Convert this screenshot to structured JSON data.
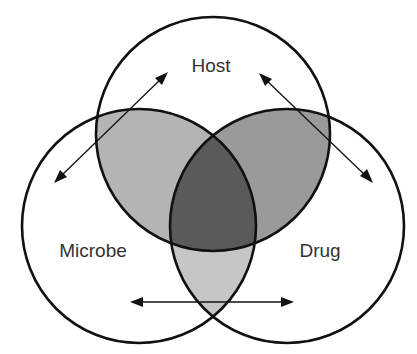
{
  "diagram": {
    "type": "venn-3",
    "sets": [
      {
        "id": "host",
        "label": "Host"
      },
      {
        "id": "microbe",
        "label": "Microbe"
      },
      {
        "id": "drug",
        "label": "Drug"
      }
    ],
    "colors": {
      "outline": "#111111",
      "label_text": "#333333",
      "background": "#ffffff",
      "host_microbe_overlap": "#b4b4b4",
      "host_drug_overlap": "#9a9a9a",
      "microbe_drug_overlap": "#c6c6c6",
      "all_three_overlap": "#5a5a5a"
    },
    "arrows": [
      {
        "id": "microbe-host",
        "from": "Microbe",
        "to": "Host",
        "bidirectional": true
      },
      {
        "id": "host-drug",
        "from": "Host",
        "to": "Drug",
        "bidirectional": true
      },
      {
        "id": "microbe-drug",
        "from": "Microbe",
        "to": "Drug",
        "bidirectional": true
      }
    ]
  }
}
